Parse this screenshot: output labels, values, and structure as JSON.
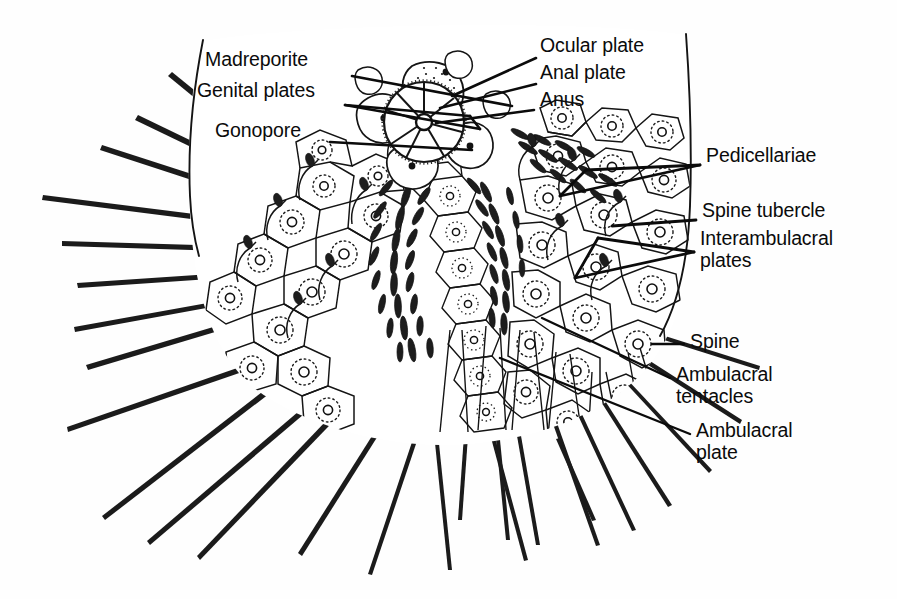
{
  "figure": {
    "background_color": "#fefefe",
    "ink_color": "#111111",
    "width": 897,
    "height": 599
  },
  "labels": {
    "madreporite": {
      "text": "Madreporite",
      "x": 205,
      "y": 58,
      "leader": "M352,76 L512,106"
    },
    "genital_plates": {
      "text": "Genital plates",
      "x": 197,
      "y": 89,
      "leader": "M345,105 L470,116 M345,105 L480,129 M470,116 L480,129"
    },
    "gonopore": {
      "text": "Gonopore",
      "x": 215,
      "y": 129,
      "leader": "M330,142 L470,148"
    },
    "ocular_plate": {
      "text": "Ocular plate",
      "x": 540,
      "y": 38,
      "leader": "M536,58 L452,96"
    },
    "anal_plate": {
      "text": "Anal plate",
      "x": 540,
      "y": 65,
      "leader": "M536,84 L440,108"
    },
    "anus": {
      "text": "Anus",
      "x": 540,
      "y": 92,
      "leader": "M534,110 L436,122"
    },
    "pedicellariae": {
      "text": "Pedicellariae",
      "x": 706,
      "y": 148,
      "leader": "M700,165 L560,196 M700,165 L586,170 M560,196 L586,170"
    },
    "spine_tubercle": {
      "text": "Spine tubercle",
      "x": 702,
      "y": 203,
      "leader": "M696,220 L612,226"
    },
    "interambulacral_plates": {
      "text": "Interambulacral\nplates",
      "x": 700,
      "y": 231,
      "leader": "M694,252 L598,238 M694,252 L575,278 M598,238 L575,278"
    },
    "spine": {
      "text": "Spine",
      "x": 690,
      "y": 332,
      "leader": "M684,344 L655,344"
    },
    "ambulacral_tentacles": {
      "text": "Ambulacral\ntentacles",
      "x": 676,
      "y": 367,
      "leader": "M670,380 L542,318"
    },
    "ambulacral_plate": {
      "text": "Ambulacral\nplate",
      "x": 696,
      "y": 423,
      "leader": "M690,437 L500,358"
    }
  },
  "anatomy_parts": [
    "test-outline",
    "apical-system",
    "madreporite-plate",
    "genital-plates",
    "ocular-plates",
    "periproct",
    "anus",
    "gonopore",
    "interambulacral-plates",
    "ambulacral-plates",
    "spine-tubercles",
    "spines",
    "pedicellariae",
    "ambulacral-tentacles"
  ],
  "counts": {
    "long_spines": 34,
    "plate_rows": 7
  }
}
